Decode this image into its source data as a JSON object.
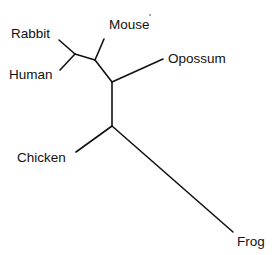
{
  "diagram": {
    "type": "unrooted-phylogenetic-tree",
    "line_color": "#111111",
    "background": "#ffffff",
    "nodes": {
      "n_rabbit_human": [
        75,
        54
      ],
      "n_mouse": [
        95,
        60
      ],
      "n_opossum": [
        112,
        82
      ],
      "n_chicken": [
        112,
        126
      ]
    },
    "branches": [
      {
        "from": "n_rabbit_human",
        "to": "leaf_rabbit",
        "x1": 75,
        "y1": 54,
        "x2": 59,
        "y2": 40
      },
      {
        "from": "n_rabbit_human",
        "to": "leaf_human",
        "x1": 75,
        "y1": 54,
        "x2": 60,
        "y2": 70
      },
      {
        "from": "n_rabbit_human",
        "to": "n_mouse",
        "x1": 75,
        "y1": 54,
        "x2": 95,
        "y2": 60
      },
      {
        "from": "n_mouse",
        "to": "leaf_mouse",
        "x1": 95,
        "y1": 60,
        "x2": 104,
        "y2": 39
      },
      {
        "from": "n_mouse",
        "to": "n_opossum",
        "x1": 95,
        "y1": 60,
        "x2": 112,
        "y2": 82
      },
      {
        "from": "n_opossum",
        "to": "leaf_opossum",
        "x1": 112,
        "y1": 82,
        "x2": 163,
        "y2": 59
      },
      {
        "from": "n_opossum",
        "to": "n_chicken",
        "x1": 112,
        "y1": 82,
        "x2": 112,
        "y2": 126
      },
      {
        "from": "n_chicken",
        "to": "leaf_chicken",
        "x1": 112,
        "y1": 126,
        "x2": 76,
        "y2": 152
      },
      {
        "from": "n_chicken",
        "to": "leaf_frog",
        "x1": 112,
        "y1": 126,
        "x2": 233,
        "y2": 232
      }
    ],
    "leaves": [
      {
        "id": "leaf_rabbit",
        "label": "Rabbit",
        "x": 11,
        "y": 38
      },
      {
        "id": "leaf_human",
        "label": "Human",
        "x": 9,
        "y": 79
      },
      {
        "id": "leaf_mouse",
        "label": "Mouse",
        "x": 109,
        "y": 29
      },
      {
        "id": "leaf_opossum",
        "label": "Opossum",
        "x": 168,
        "y": 63
      },
      {
        "id": "leaf_chicken",
        "label": "Chicken",
        "x": 17,
        "y": 162
      },
      {
        "id": "leaf_frog",
        "label": "Frog",
        "x": 237,
        "y": 246
      }
    ],
    "artifact_dot": {
      "x": 150,
      "y": 15
    }
  }
}
